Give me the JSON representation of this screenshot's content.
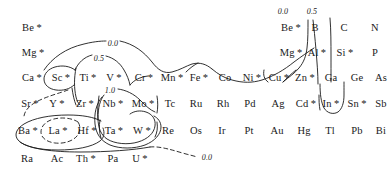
{
  "figure": {
    "type": "periodic-table-contour-map",
    "width": 391,
    "height": 176,
    "background": "#ffffff",
    "ink": "#1a1a1a"
  },
  "elements": [
    {
      "symbol": "Be",
      "label": "Be *",
      "star": true,
      "x": 32,
      "y": 27
    },
    {
      "symbol": "Mg",
      "label": "Mg *",
      "star": true,
      "x": 33,
      "y": 52
    },
    {
      "symbol": "Ca",
      "label": "Ca *",
      "star": true,
      "x": 32,
      "y": 77
    },
    {
      "symbol": "Sc",
      "label": "Sc *",
      "star": true,
      "x": 61,
      "y": 77
    },
    {
      "symbol": "Ti",
      "label": "Ti *",
      "star": true,
      "x": 88,
      "y": 77
    },
    {
      "symbol": "V",
      "label": "V *",
      "star": true,
      "x": 114,
      "y": 77
    },
    {
      "symbol": "Cr",
      "label": "Cr *",
      "star": true,
      "x": 144,
      "y": 77
    },
    {
      "symbol": "Mn",
      "label": "Mn *",
      "star": true,
      "x": 172,
      "y": 77
    },
    {
      "symbol": "Fe",
      "label": "Fe *",
      "star": true,
      "x": 199,
      "y": 77
    },
    {
      "symbol": "Co",
      "label": "Co",
      "star": false,
      "x": 225,
      "y": 77
    },
    {
      "symbol": "Ni",
      "label": "Ni *",
      "star": true,
      "x": 252,
      "y": 77
    },
    {
      "symbol": "Cu",
      "label": "Cu *",
      "star": true,
      "x": 279,
      "y": 77
    },
    {
      "symbol": "Zn",
      "label": "Zn *",
      "star": true,
      "x": 305,
      "y": 77
    },
    {
      "symbol": "Ga",
      "label": "Ga",
      "star": false,
      "x": 331,
      "y": 77
    },
    {
      "symbol": "Ge",
      "label": "Ge",
      "star": false,
      "x": 357,
      "y": 77
    },
    {
      "symbol": "As",
      "label": "As",
      "star": false,
      "x": 381,
      "y": 77
    },
    {
      "symbol": "Sr",
      "label": "Sr *",
      "star": true,
      "x": 30,
      "y": 103
    },
    {
      "symbol": "Y",
      "label": "Y *",
      "star": true,
      "x": 57,
      "y": 103
    },
    {
      "symbol": "Zr",
      "label": "Zr *",
      "star": true,
      "x": 85,
      "y": 103
    },
    {
      "symbol": "Nb",
      "label": "Nb *",
      "star": true,
      "x": 113,
      "y": 103
    },
    {
      "symbol": "Mo",
      "label": "Mo *",
      "star": true,
      "x": 143,
      "y": 103
    },
    {
      "symbol": "Tc",
      "label": "Tc",
      "star": false,
      "x": 170,
      "y": 103
    },
    {
      "symbol": "Ru",
      "label": "Ru",
      "star": false,
      "x": 196,
      "y": 103
    },
    {
      "symbol": "Rh",
      "label": "Rh",
      "star": false,
      "x": 223,
      "y": 103
    },
    {
      "symbol": "Pd",
      "label": "Pd",
      "star": false,
      "x": 250,
      "y": 103
    },
    {
      "symbol": "Ag",
      "label": "Ag",
      "star": false,
      "x": 278,
      "y": 103
    },
    {
      "symbol": "Cd",
      "label": "Cd *",
      "star": true,
      "x": 306,
      "y": 103
    },
    {
      "symbol": "In",
      "label": "In *",
      "star": true,
      "x": 331,
      "y": 103
    },
    {
      "symbol": "Sn",
      "label": "Sn *",
      "star": true,
      "x": 357,
      "y": 103
    },
    {
      "symbol": "Sb",
      "label": "Sb",
      "star": false,
      "x": 381,
      "y": 103
    },
    {
      "symbol": "Ba",
      "label": "Ba *",
      "star": true,
      "x": 28,
      "y": 130
    },
    {
      "symbol": "La",
      "label": "La *",
      "star": true,
      "x": 58,
      "y": 130
    },
    {
      "symbol": "Hf",
      "label": "Hf *",
      "star": true,
      "x": 87,
      "y": 130
    },
    {
      "symbol": "Ta",
      "label": "Ta *",
      "star": true,
      "x": 114,
      "y": 130
    },
    {
      "symbol": "W",
      "label": "W *",
      "star": true,
      "x": 142,
      "y": 130
    },
    {
      "symbol": "Re",
      "label": "Re",
      "star": false,
      "x": 168,
      "y": 130
    },
    {
      "symbol": "Os",
      "label": "Os",
      "star": false,
      "x": 196,
      "y": 130
    },
    {
      "symbol": "Ir",
      "label": "Ir",
      "star": false,
      "x": 222,
      "y": 130
    },
    {
      "symbol": "Pt",
      "label": "Pt",
      "star": false,
      "x": 249,
      "y": 130
    },
    {
      "symbol": "Au",
      "label": "Au",
      "star": false,
      "x": 277,
      "y": 130
    },
    {
      "symbol": "Hg",
      "label": "Hg",
      "star": false,
      "x": 304,
      "y": 130
    },
    {
      "symbol": "Tl",
      "label": "Tl",
      "star": false,
      "x": 330,
      "y": 130
    },
    {
      "symbol": "Pb",
      "label": "Pb",
      "star": false,
      "x": 357,
      "y": 130
    },
    {
      "symbol": "Bi",
      "label": "Bi",
      "star": false,
      "x": 381,
      "y": 130
    },
    {
      "symbol": "Ra",
      "label": "Ra",
      "star": false,
      "x": 27,
      "y": 158
    },
    {
      "symbol": "Ac",
      "label": "Ac",
      "star": false,
      "x": 57,
      "y": 158
    },
    {
      "symbol": "Th",
      "label": "Th *",
      "star": true,
      "x": 86,
      "y": 158
    },
    {
      "symbol": "Pa",
      "label": "Pa",
      "star": false,
      "x": 113,
      "y": 158
    },
    {
      "symbol": "U",
      "label": "U *",
      "star": true,
      "x": 140,
      "y": 158
    },
    {
      "symbol": "Be2",
      "label": "Be *",
      "star": true,
      "x": 291,
      "y": 27
    },
    {
      "symbol": "B",
      "label": "B",
      "star": false,
      "x": 315,
      "y": 27
    },
    {
      "symbol": "C",
      "label": "C",
      "star": false,
      "x": 344,
      "y": 27
    },
    {
      "symbol": "N",
      "label": "N",
      "star": false,
      "x": 375,
      "y": 27
    },
    {
      "symbol": "Mg2",
      "label": "Mg *",
      "star": true,
      "x": 291,
      "y": 52
    },
    {
      "symbol": "Al",
      "label": "Al *",
      "star": true,
      "x": 317,
      "y": 52
    },
    {
      "symbol": "Si",
      "label": "Si *",
      "star": true,
      "x": 345,
      "y": 52
    },
    {
      "symbol": "P",
      "label": "P",
      "star": false,
      "x": 375,
      "y": 52
    }
  ],
  "contour_labels": [
    {
      "id": "left-00",
      "text": "0.0",
      "x": 113,
      "y": 43
    },
    {
      "id": "left-05",
      "text": "0.5",
      "x": 99,
      "y": 58
    },
    {
      "id": "mid-10",
      "text": "1.0",
      "x": 110,
      "y": 90
    },
    {
      "id": "right-00",
      "text": "0.0",
      "x": 283,
      "y": 11
    },
    {
      "id": "right-05",
      "text": "0.5",
      "x": 312,
      "y": 11
    },
    {
      "id": "bottom-00",
      "text": "0.0",
      "x": 207,
      "y": 157
    }
  ],
  "chart_data": {
    "type": "heatmap",
    "title": "",
    "xlabel": "",
    "ylabel": "",
    "contour_levels": [
      "0.0",
      "0.5",
      "1.0"
    ],
    "starred_elements": [
      "Be",
      "Mg",
      "Ca",
      "Sc",
      "Ti",
      "V",
      "Cr",
      "Mn",
      "Fe",
      "Ni",
      "Cu",
      "Zn",
      "Sr",
      "Y",
      "Zr",
      "Nb",
      "Mo",
      "Cd",
      "In",
      "Sn",
      "Ba",
      "La",
      "Hf",
      "Ta",
      "W",
      "Th",
      "U",
      "Al",
      "Si"
    ],
    "unstarred_elements": [
      "Co",
      "Ga",
      "Ge",
      "As",
      "Tc",
      "Ru",
      "Rh",
      "Pd",
      "Ag",
      "Sb",
      "Re",
      "Os",
      "Ir",
      "Pt",
      "Au",
      "Hg",
      "Tl",
      "Pb",
      "Bi",
      "Ra",
      "Ac",
      "Pa",
      "B",
      "C",
      "N",
      "P"
    ]
  }
}
